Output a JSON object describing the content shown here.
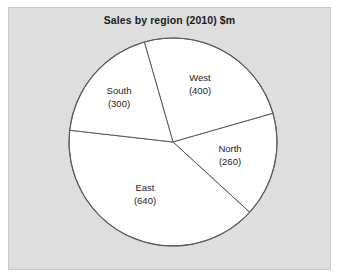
{
  "chart_data": {
    "type": "pie",
    "title": "Sales by region (2010) $m",
    "unit": "$m",
    "year": "2010",
    "categories": [
      "West",
      "North",
      "East",
      "South"
    ],
    "values": [
      400,
      260,
      640,
      300
    ],
    "total": 1600,
    "labels": [
      {
        "name": "West",
        "value": 400,
        "value_text": "(400)",
        "start_angle": 344,
        "sweep": 90,
        "label_x": 200,
        "label_y": 84
      },
      {
        "name": "North",
        "value": 260,
        "value_text": "(260)",
        "start_angle": 74,
        "sweep": 58.5,
        "label_x": 230,
        "label_y": 155
      },
      {
        "name": "East",
        "value": 640,
        "value_text": "(640)",
        "start_angle": 132.5,
        "sweep": 144,
        "label_x": 145,
        "label_y": 194
      },
      {
        "name": "South",
        "value": 300,
        "value_text": "(300)",
        "start_angle": 276.5,
        "sweep": 67.5,
        "label_x": 119,
        "label_y": 97
      }
    ],
    "legend": "none",
    "grid": false,
    "slice_fill": "#ffffff",
    "slice_stroke": "#5a5a5a",
    "plot_background": "#dedede",
    "figure_background": "#ffffff",
    "text_color": "#1c1c1c",
    "geometry": {
      "cx": 173,
      "cy": 142,
      "r": 104
    }
  }
}
